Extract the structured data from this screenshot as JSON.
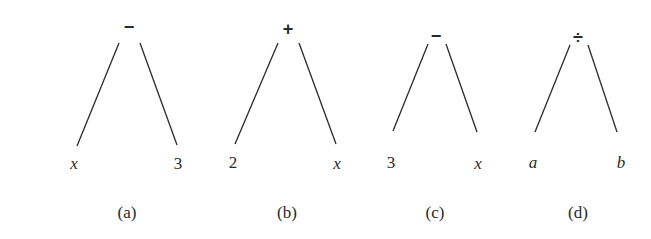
{
  "trees": [
    {
      "id": "a",
      "operator": "−",
      "left": "x",
      "right": "3",
      "caption": "(a)"
    },
    {
      "id": "b",
      "operator": "+",
      "left": "2",
      "right": "x",
      "caption": "(b)"
    },
    {
      "id": "c",
      "operator": "−",
      "left": "3",
      "right": "x",
      "caption": "(c)"
    },
    {
      "id": "d",
      "operator": "÷",
      "left": "a",
      "right": "b",
      "caption": "(d)"
    }
  ],
  "colors": {
    "stroke": "#2a2a2a",
    "background": "#ffffff"
  }
}
